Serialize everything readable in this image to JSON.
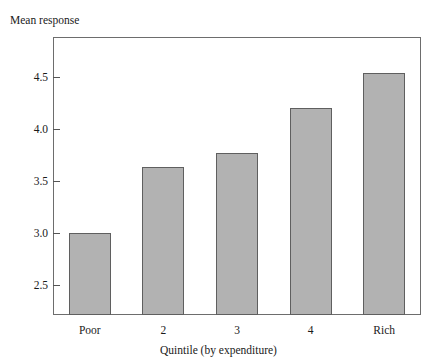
{
  "figure": {
    "top_bleed_text": "",
    "y_axis_caption": "Mean response",
    "x_axis_title": "Quintile (by expenditure)",
    "bar_fill_color": "#b2b2b2",
    "bar_edge_color": "#5f5f5f",
    "frame_color": "#6d6d6d"
  },
  "chart_data": {
    "type": "bar",
    "title": "",
    "xlabel": "Quintile (by expenditure)",
    "ylabel": "Mean response",
    "categories": [
      "Poor",
      "2",
      "3",
      "4",
      "Rich"
    ],
    "values": [
      3.0,
      3.64,
      3.77,
      4.21,
      4.54
    ],
    "ylim": [
      2.21,
      4.89
    ],
    "yticks": [
      2.5,
      3.0,
      3.5,
      4.0,
      4.5
    ],
    "ytick_labels": [
      "2.5",
      "3.0",
      "3.5",
      "4.0",
      "4.5"
    ],
    "grid": false,
    "legend": null,
    "series": [
      {
        "name": "Mean response",
        "values": [
          3.0,
          3.64,
          3.77,
          4.21,
          4.54
        ]
      }
    ]
  }
}
